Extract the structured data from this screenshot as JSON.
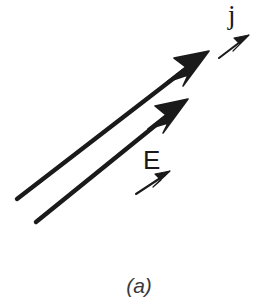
{
  "figure": {
    "caption": "(a)",
    "background_color": "#ffffff",
    "ink_color": "#1a1a1a",
    "width": 278,
    "height": 305,
    "labels": [
      {
        "id": "j",
        "text": "j",
        "name": "current-density-label",
        "x": 228,
        "y": 2,
        "font_size": 27
      },
      {
        "id": "E",
        "text": "E",
        "name": "electric-field-label",
        "x": 143,
        "y": 147,
        "font_size": 26
      }
    ],
    "vectors": [
      {
        "id": "j-vector",
        "name": "thick-arrow-j",
        "tail": [
          17,
          199
        ],
        "tip": [
          209,
          51
        ],
        "stroke_width": 4.2,
        "head_length": 34,
        "head_half_width": 9
      },
      {
        "id": "E-vector",
        "name": "thick-arrow-E",
        "tail": [
          36,
          222
        ],
        "tip": [
          188,
          99
        ],
        "stroke_width": 4.2,
        "head_length": 32,
        "head_half_width": 8.5
      }
    ],
    "direction_markers": [
      {
        "id": "j-marker",
        "name": "small-arrow-j",
        "tail": [
          219,
          58
        ],
        "tip": [
          249,
          35
        ],
        "stroke_width": 2.0,
        "head_length": 15,
        "head_half_width": 4
      },
      {
        "id": "E-marker",
        "name": "small-arrow-E",
        "tail": [
          136,
          194
        ],
        "tip": [
          170,
          171
        ],
        "stroke_width": 2.0,
        "head_length": 15,
        "head_half_width": 4
      }
    ]
  }
}
